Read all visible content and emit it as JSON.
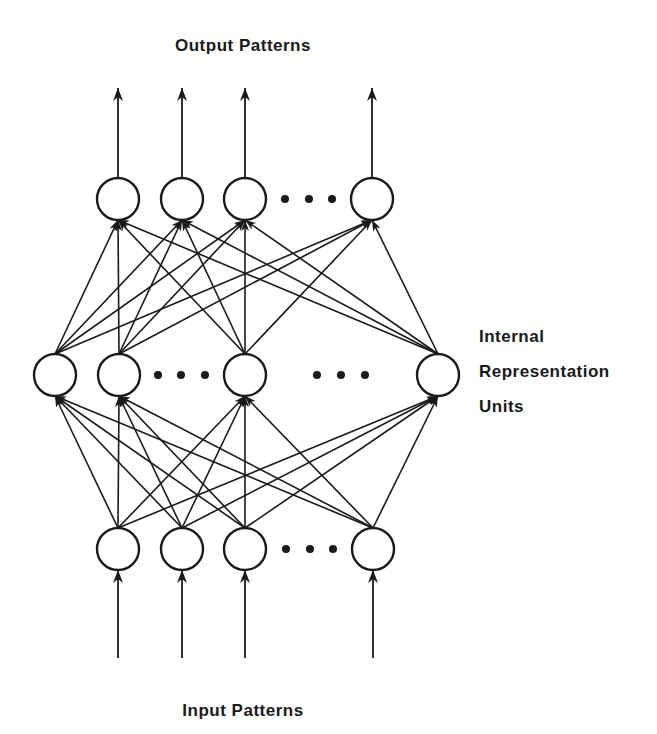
{
  "diagram": {
    "title_output": "Output Patterns",
    "title_input": "Input Patterns",
    "hidden_label_lines": [
      "Internal",
      "Representation",
      "Units"
    ],
    "colors": {
      "stroke": "#1a1a1a",
      "background": "#ffffff"
    },
    "node_radius": 21,
    "layers": {
      "output": {
        "name": "Output Units",
        "y": 199,
        "nodes_x": [
          118,
          182,
          245,
          372
        ],
        "ellipsis_x": [
          285,
          309,
          332
        ]
      },
      "hidden": {
        "name": "Internal Representation Units",
        "y": 375,
        "nodes_x": [
          55,
          119,
          245,
          438
        ],
        "ellipsis_x": [
          158,
          181,
          205,
          317,
          341,
          365
        ]
      },
      "input": {
        "name": "Input Units",
        "y": 549,
        "nodes_x": [
          118,
          182,
          245,
          373
        ],
        "ellipsis_x": [
          286,
          310,
          333
        ]
      }
    },
    "connections": [
      {
        "from": "input",
        "to": "hidden",
        "type": "fully-connected"
      },
      {
        "from": "hidden",
        "to": "output",
        "type": "fully-connected"
      }
    ],
    "output_arrows": {
      "y_start": 178,
      "y_tip": 88
    },
    "input_arrows": {
      "y_start": 658,
      "y_tip": 570
    },
    "label_positions": {
      "output_title": {
        "x": 243,
        "y": 51
      },
      "input_title": {
        "x": 243,
        "y": 716
      },
      "hidden_label": {
        "x": 479,
        "y_lines": [
          342,
          377,
          412
        ]
      }
    }
  }
}
